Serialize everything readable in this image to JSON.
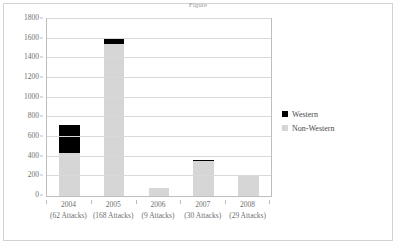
{
  "page": {
    "title_sliver": "Figure",
    "border_color": "#d2d2d2"
  },
  "legend": {
    "position": "right",
    "entries": [
      {
        "label": "Western",
        "color": "#000000",
        "swatch": "black-square-icon"
      },
      {
        "label": "Non-Western",
        "color": "#d6d6d6",
        "swatch": "gray-square-icon"
      }
    ]
  },
  "chart_data": {
    "type": "bar",
    "subtype": "stacked-column",
    "title": "",
    "xlabel": "",
    "ylabel": "",
    "ylim": [
      0,
      1800
    ],
    "y_tick_step": 200,
    "y_ticks": [
      0,
      200,
      400,
      600,
      800,
      1000,
      1200,
      1400,
      1600,
      1800
    ],
    "y_tick_labels": [
      "0",
      "200",
      "400",
      "600",
      "800",
      "1000",
      "1200",
      "1400",
      "1600",
      "1800"
    ],
    "grid": "horizontal",
    "categories": [
      "2004",
      "2005",
      "2006",
      "2007",
      "2008"
    ],
    "category_sublabels": [
      "(62 Attacks)",
      "(168 Attacks)",
      "(9 Attacks)",
      "(30 Attacks)",
      "(29 Attacks)"
    ],
    "series": [
      {
        "name": "Non-Western",
        "color": "#d6d6d6",
        "values": [
          440,
          1550,
          85,
          355,
          205
        ]
      },
      {
        "name": "Western",
        "color": "#000000",
        "values": [
          280,
          60,
          0,
          5,
          8
        ]
      }
    ],
    "totals": [
      720,
      1610,
      85,
      360,
      213
    ]
  }
}
